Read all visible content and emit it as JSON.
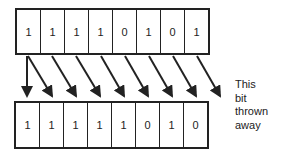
{
  "top_register": {
    "bits": [
      "1",
      "1",
      "1",
      "1",
      "0",
      "1",
      "0",
      "1"
    ]
  },
  "bottom_register": {
    "bits": [
      "1",
      "1",
      "1",
      "1",
      "1",
      "0",
      "1",
      "0"
    ]
  },
  "annotation": {
    "lines": [
      "This",
      "bit",
      "thrown",
      "away"
    ]
  },
  "colors": {
    "stroke": "#222222",
    "background": "#ffffff"
  }
}
